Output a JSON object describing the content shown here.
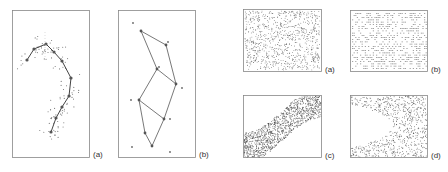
{
  "figure_left": {
    "panels": [
      {
        "label": "(a)"
      },
      {
        "label": "(b)"
      }
    ]
  },
  "figure_right": {
    "panels": [
      {
        "label": "(a)"
      },
      {
        "label": "(b)"
      },
      {
        "label": "(c)"
      },
      {
        "label": "(d)"
      }
    ]
  },
  "colors": {
    "ink": "#444444",
    "frame": "#777777",
    "dots": "#555555"
  }
}
